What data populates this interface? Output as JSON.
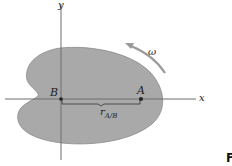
{
  "diagram": {
    "type": "rigid-body-kinematics",
    "body": {
      "fill_color": "#a9a9a9",
      "outline_color": "#8c8c8c"
    },
    "axes": {
      "x_label": "x",
      "y_label": "y",
      "color": "#6e6e6e"
    },
    "points": {
      "B": {
        "label": "B"
      },
      "A": {
        "label": "A"
      }
    },
    "relative_position": {
      "symbol": "r",
      "subscript": "A/B"
    },
    "angular_velocity": {
      "symbol": "ω",
      "direction": "counterclockwise",
      "arrow_color": "#9a9a9a"
    },
    "figure_label_fragment": "F"
  }
}
